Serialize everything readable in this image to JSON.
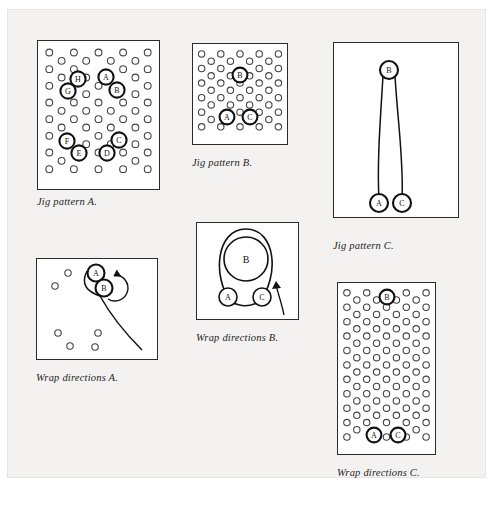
{
  "page": {
    "background": "#f3f2f0",
    "panel_background": "#ffffff",
    "ink": "#2b2b2b"
  },
  "figures": [
    {
      "id": "jig-pattern-a",
      "caption": "Jig pattern A.",
      "frame": {
        "x": 37,
        "y": 40,
        "w": 123,
        "h": 150
      },
      "caption_pos": {
        "x": 37,
        "y": 196
      },
      "type": "peg-grid",
      "grid": {
        "cols": 5,
        "rows": 8,
        "stagger": true,
        "dot_r": 3.4
      },
      "labeled_pegs": [
        {
          "label": "H",
          "x": 78,
          "y": 79
        },
        {
          "label": "A",
          "x": 106,
          "y": 77
        },
        {
          "label": "G",
          "x": 68,
          "y": 91
        },
        {
          "label": "B",
          "x": 117,
          "y": 90
        },
        {
          "label": "F",
          "x": 67,
          "y": 141
        },
        {
          "label": "C",
          "x": 119,
          "y": 140
        },
        {
          "label": "E",
          "x": 79,
          "y": 153
        },
        {
          "label": "D",
          "x": 107,
          "y": 153
        }
      ]
    },
    {
      "id": "jig-pattern-b",
      "caption": "Jig pattern B.",
      "frame": {
        "x": 192,
        "y": 43,
        "w": 96,
        "h": 102
      },
      "caption_pos": {
        "x": 192,
        "y": 157
      },
      "type": "peg-grid",
      "grid": {
        "cols": 5,
        "rows": 6,
        "stagger": true,
        "dot_r": 3.2
      },
      "labeled_pegs": [
        {
          "label": "B",
          "x": 240,
          "y": 75
        },
        {
          "label": "A",
          "x": 227,
          "y": 117
        },
        {
          "label": "C",
          "x": 250,
          "y": 117
        }
      ]
    },
    {
      "id": "jig-pattern-c",
      "caption": "Jig pattern C.",
      "frame": {
        "x": 333,
        "y": 42,
        "w": 126,
        "h": 176
      },
      "caption_pos": {
        "x": 333,
        "y": 240
      },
      "type": "long-loop",
      "labeled_pegs": [
        {
          "label": "B",
          "x": 389,
          "y": 70
        },
        {
          "label": "A",
          "x": 379,
          "y": 203
        },
        {
          "label": "C",
          "x": 402,
          "y": 203
        }
      ]
    },
    {
      "id": "wrap-directions-a",
      "caption": "Wrap directions A.",
      "frame": {
        "x": 36,
        "y": 258,
        "w": 122,
        "h": 102
      },
      "caption_pos": {
        "x": 36,
        "y": 372
      },
      "type": "wrap-a",
      "labeled_pegs": [
        {
          "label": "A",
          "x": 96,
          "y": 273
        },
        {
          "label": "B",
          "x": 104,
          "y": 288
        }
      ],
      "plain_pegs": [
        {
          "x": 68,
          "y": 273
        },
        {
          "x": 55,
          "y": 286
        },
        {
          "x": 58,
          "y": 333
        },
        {
          "x": 70,
          "y": 346
        },
        {
          "x": 95,
          "y": 347
        },
        {
          "x": 98,
          "y": 333
        }
      ]
    },
    {
      "id": "wrap-directions-b",
      "caption": "Wrap directions B.",
      "frame": {
        "x": 196,
        "y": 222,
        "w": 103,
        "h": 98
      },
      "caption_pos": {
        "x": 196,
        "y": 332
      },
      "type": "wrap-b",
      "labeled_pegs": [
        {
          "label": "B",
          "x": 246,
          "y": 259
        },
        {
          "label": "A",
          "x": 228,
          "y": 297
        },
        {
          "label": "C",
          "x": 262,
          "y": 297
        }
      ]
    },
    {
      "id": "wrap-directions-c",
      "caption": "Wrap directions C.",
      "frame": {
        "x": 337,
        "y": 282,
        "w": 99,
        "h": 173
      },
      "caption_pos": {
        "x": 337,
        "y": 467
      },
      "type": "peg-grid",
      "grid": {
        "cols": 5,
        "rows": 11,
        "stagger": true,
        "dot_r": 3.2
      },
      "labeled_pegs": [
        {
          "label": "B",
          "x": 387,
          "y": 297
        },
        {
          "label": "A",
          "x": 374,
          "y": 435
        },
        {
          "label": "C",
          "x": 398,
          "y": 435
        }
      ]
    }
  ]
}
